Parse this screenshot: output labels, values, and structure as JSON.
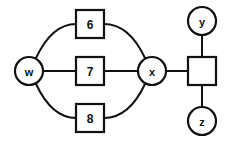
{
  "diagram": {
    "background_color": "#ffffff",
    "stroke_color": "#111111",
    "fill_color": "#ffffff",
    "nodes": [
      {
        "id": "w",
        "label": "w",
        "shape": "circle",
        "cx": 29,
        "cy": 71,
        "r": 14
      },
      {
        "id": "box6",
        "label": "6",
        "shape": "square",
        "x": 76,
        "y": 10,
        "w": 28,
        "h": 28
      },
      {
        "id": "box7",
        "label": "7",
        "shape": "square",
        "x": 76,
        "y": 57,
        "w": 28,
        "h": 28
      },
      {
        "id": "box8",
        "label": "8",
        "shape": "square",
        "x": 76,
        "y": 104,
        "w": 28,
        "h": 28
      },
      {
        "id": "x",
        "label": "x",
        "shape": "circle",
        "cx": 152,
        "cy": 71,
        "r": 14
      },
      {
        "id": "blank",
        "label": "",
        "shape": "square",
        "x": 188,
        "y": 57,
        "w": 28,
        "h": 28
      },
      {
        "id": "y",
        "label": "y",
        "shape": "circle",
        "cx": 202,
        "cy": 21,
        "r": 14
      },
      {
        "id": "z",
        "label": "z",
        "shape": "circle",
        "cx": 202,
        "cy": 121,
        "r": 14
      }
    ],
    "edges": [
      {
        "from": "w",
        "to": "box6",
        "style": "curved",
        "path": "M 36 58 Q 52 24 76 24"
      },
      {
        "from": "box6",
        "to": "x",
        "style": "curved",
        "path": "M 104 24 Q 129 24 145 58"
      },
      {
        "from": "w",
        "to": "box7",
        "style": "straight",
        "path": "M 43 71 L 76 71"
      },
      {
        "from": "box7",
        "to": "x",
        "style": "straight",
        "path": "M 104 71 L 138 71"
      },
      {
        "from": "w",
        "to": "box8",
        "style": "curved",
        "path": "M 36 84 Q 52 118 76 118"
      },
      {
        "from": "box8",
        "to": "x",
        "style": "curved",
        "path": "M 104 118 Q 129 118 145 84"
      },
      {
        "from": "x",
        "to": "blank",
        "style": "straight",
        "path": "M 166 71 L 188 71"
      },
      {
        "from": "blank",
        "to": "y",
        "style": "straight",
        "path": "M 202 57 L 202 35"
      },
      {
        "from": "blank",
        "to": "z",
        "style": "straight",
        "path": "M 202 85 L 202 107"
      }
    ]
  }
}
